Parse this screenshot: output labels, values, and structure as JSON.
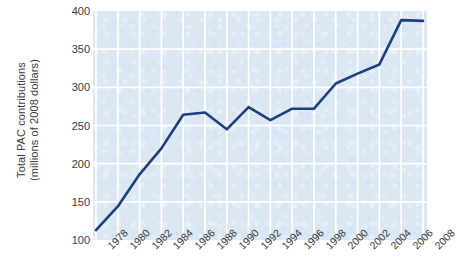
{
  "chart_data": {
    "type": "line",
    "title": "",
    "xlabel": "",
    "ylabel": "Total PAC contributions (millions of 2008 dollars)",
    "ylabel_line1": "Total PAC contributions",
    "ylabel_line2": "(millions of 2008 dollars)",
    "categories": [
      "1978",
      "1980",
      "1982",
      "1984",
      "1986",
      "1988",
      "1990",
      "1992",
      "1994",
      "1996",
      "1998",
      "2000",
      "2002",
      "2004",
      "2006",
      "2008"
    ],
    "values": [
      113,
      144,
      186,
      220,
      264,
      267,
      245,
      274,
      257,
      272,
      272,
      305,
      318,
      330,
      388,
      387
    ],
    "series": [
      {
        "name": "Total PAC contributions",
        "values": [
          113,
          144,
          186,
          220,
          264,
          267,
          245,
          274,
          257,
          272,
          272,
          305,
          318,
          330,
          388,
          387
        ]
      }
    ],
    "ylim": [
      100,
      400
    ],
    "yticks": [
      100,
      150,
      200,
      250,
      300,
      350,
      400
    ],
    "ytick_labels": [
      "100",
      "150",
      "200",
      "250",
      "300",
      "350",
      "400"
    ],
    "xlim": [
      "1978",
      "2008"
    ],
    "grid": true,
    "legend": "none",
    "line_color": "#1f3f7a",
    "plot_background": "#dbe8f4",
    "gridline_color": "#ffffff",
    "page_background": "#ffffff",
    "tick_text_color": "#3a3a3a"
  }
}
